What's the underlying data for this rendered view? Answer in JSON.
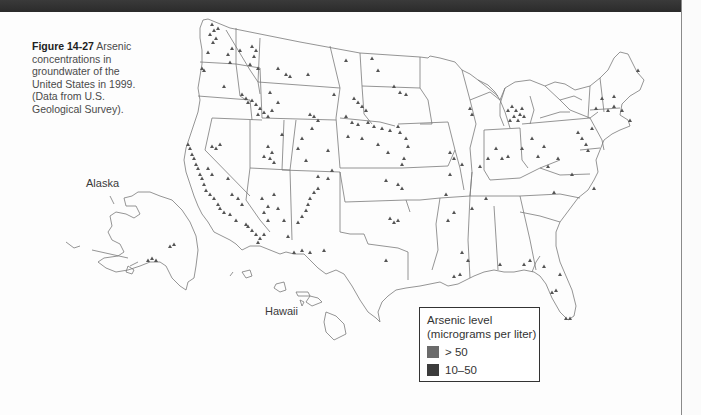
{
  "caption": {
    "figure_number": "Figure 14-27",
    "text": " Arsenic concentrations in groundwater of the United States in 1999. (Data from U.S. Geological Survey)."
  },
  "labels": {
    "alaska": "Alaska",
    "hawaii": "Hawaii"
  },
  "legend": {
    "title_line1": "Arsenic level",
    "title_line2": "(micrograms per liter)",
    "items": [
      {
        "label": "> 50",
        "color": "#6b6b6b"
      },
      {
        "label": "10–50",
        "color": "#3c3c3c"
      }
    ]
  },
  "colors": {
    "outline": "#7a7a7a",
    "marker": "#555555",
    "topbar": "#2f2f2f"
  }
}
